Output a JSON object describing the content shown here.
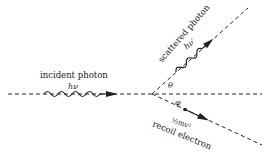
{
  "diagram": {
    "incident": {
      "label": "incident photon",
      "energy": "hν"
    },
    "scattered": {
      "label": "scattered photon",
      "energy": "hν′"
    },
    "electron": {
      "label": "recoil electron",
      "energy": "½mv²"
    },
    "angles": {
      "theta": "θ",
      "phi": "φ"
    },
    "colors": {
      "line": "#222222",
      "background": "#ffffff"
    }
  }
}
